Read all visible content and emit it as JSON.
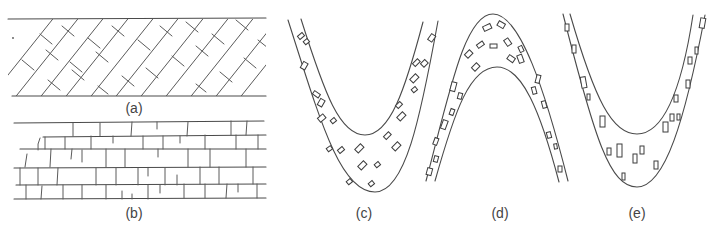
{
  "figure": {
    "panels": [
      {
        "id": "a",
        "label": "(a)",
        "description": "Straight layer with inclined (diagonal) brick-like blocks"
      },
      {
        "id": "b",
        "label": "(b)",
        "description": "Straight layer with horizontal brick-like blocks"
      },
      {
        "id": "c",
        "label": "(c)",
        "description": "Synform (U-shaped fold) layer with scattered rectangular clasts, rotated"
      },
      {
        "id": "d",
        "label": "(d)",
        "description": "Antiform (arch-shaped fold) layer with scattered rectangular clasts"
      },
      {
        "id": "e",
        "label": "(e)",
        "description": "Synform (U-shaped fold) layer with vertically oriented rectangular clasts"
      }
    ]
  },
  "colors": {
    "line": "#4a4a4a",
    "background": "#ffffff"
  }
}
